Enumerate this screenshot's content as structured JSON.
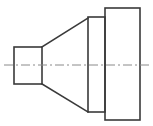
{
  "document": {
    "type": "engineering-drawing",
    "title": "Reducer / Cone Transition Part — Side Elevation",
    "view": "side elevation (orthographic)",
    "canvas": {
      "width": 153,
      "height": 126
    },
    "background_color": "#ffffff"
  },
  "styles": {
    "outline_color": "#3a3a3a",
    "outline_width": 1.6,
    "centerline_color": "#8a8a8a",
    "centerline_width": 1.0,
    "centerline_dash": "9,3,2,3"
  },
  "geometry": {
    "centerline": {
      "label": "axis-centerline",
      "y": 65,
      "x_start": 4,
      "x_end": 149
    },
    "small_end_square": {
      "label": "small-end-square-section",
      "x": 14,
      "y": 47,
      "width": 28,
      "height": 37
    },
    "taper_upper": {
      "label": "upper-taper-line",
      "x1": 42,
      "y1": 47,
      "x2": 88,
      "y2": 18
    },
    "taper_lower": {
      "label": "lower-taper-line",
      "x1": 42,
      "y1": 84,
      "x2": 88,
      "y2": 112
    },
    "mid_flange": {
      "label": "middle-flange-rectangle",
      "x": 88,
      "y": 17,
      "width": 17,
      "height": 95
    },
    "large_end": {
      "label": "large-end-rectangle",
      "x": 105,
      "y": 8,
      "width": 35,
      "height": 112
    }
  },
  "annotations": {
    "dimensions": [],
    "labels": [],
    "notes": []
  }
}
